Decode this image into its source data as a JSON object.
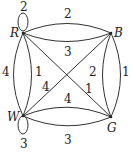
{
  "graph": {
    "nodes": [
      {
        "id": "R",
        "label": "R"
      },
      {
        "id": "B",
        "label": "B"
      },
      {
        "id": "W",
        "label": "W"
      },
      {
        "id": "G",
        "label": "G"
      }
    ],
    "edges": [
      {
        "from": "R",
        "to": "R",
        "weight": "2",
        "kind": "loop"
      },
      {
        "from": "R",
        "to": "B",
        "weight": "2",
        "kind": "upper-arc"
      },
      {
        "from": "R",
        "to": "B",
        "weight": "3",
        "kind": "lower-arc"
      },
      {
        "from": "R",
        "to": "W",
        "weight": "4",
        "kind": "outer-arc"
      },
      {
        "from": "R",
        "to": "W",
        "weight": "1",
        "kind": "inner-arc"
      },
      {
        "from": "R",
        "to": "G",
        "weight": "1",
        "kind": "diagonal"
      },
      {
        "from": "W",
        "to": "B",
        "weight": "4",
        "kind": "diagonal"
      },
      {
        "from": "B",
        "to": "G",
        "weight": "2",
        "kind": "inner-arc"
      },
      {
        "from": "B",
        "to": "G",
        "weight": "1",
        "kind": "outer-arc"
      },
      {
        "from": "W",
        "to": "G",
        "weight": "4",
        "kind": "upper-arc"
      },
      {
        "from": "W",
        "to": "G",
        "weight": "3",
        "kind": "lower-arc"
      },
      {
        "from": "W",
        "to": "W",
        "weight": "3",
        "kind": "loop"
      }
    ]
  }
}
